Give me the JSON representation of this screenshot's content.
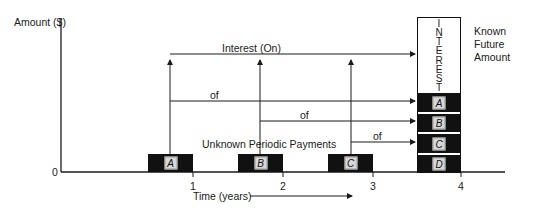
{
  "diagram": {
    "y_axis_label": "Amount ($)",
    "origin_label": "0",
    "x_axis_label": "Time (years)",
    "x_ticks": [
      "1",
      "2",
      "3",
      "4"
    ],
    "interest_label": "Interest (On)",
    "of_labels": [
      "of",
      "of",
      "of"
    ],
    "payments_label": "Unknown Periodic Payments",
    "payments": [
      {
        "tag": "A"
      },
      {
        "tag": "B"
      },
      {
        "tag": "C"
      }
    ],
    "future_value": {
      "interest_letters": [
        "I",
        "N",
        "T",
        "E",
        "R",
        "E",
        "S",
        "T"
      ],
      "segments": [
        "A",
        "B",
        "C",
        "D"
      ],
      "label_line1": "Known",
      "label_line2": "Future",
      "label_line3": "Amount"
    },
    "colors": {
      "block": "#111111",
      "tag_bg": "#d8d8d8",
      "line": "#1a1a1a"
    }
  }
}
